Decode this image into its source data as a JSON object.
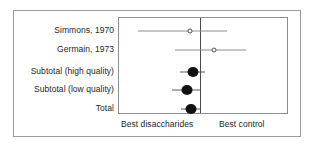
{
  "chart_data": {
    "type": "forest",
    "title": "",
    "xlabel": "",
    "ylabel": "",
    "grid": false,
    "null_line_value": 1.0,
    "xlim": [
      0.1,
      4.2
    ],
    "axis_captions": {
      "left": "Best disaccharides",
      "right": "Best control"
    },
    "marker_legend": {
      "open_circle": "individual study",
      "filled_circle": "pooled estimate"
    },
    "rows": [
      {
        "label": "Simmons, 1970",
        "marker": "open-circle",
        "estimate": 0.78,
        "ci_low": 0.22,
        "ci_high": 1.95,
        "crosses_null": true
      },
      {
        "label": "Germain, 1973",
        "marker": "open-circle",
        "estimate": 1.42,
        "ci_low": 0.55,
        "ci_high": 3.05,
        "crosses_null": true
      },
      {
        "label": "Subtotal (high quality)",
        "marker": "filled-circle",
        "estimate": 0.85,
        "ci_low": 0.62,
        "ci_high": 1.12,
        "crosses_null": true
      },
      {
        "label": "Subtotal (low quality)",
        "marker": "filled-circle",
        "estimate": 0.72,
        "ci_low": 0.5,
        "ci_high": 0.99,
        "crosses_null": false
      },
      {
        "label": "Total",
        "marker": "filled-circle",
        "estimate": 0.8,
        "ci_low": 0.63,
        "ci_high": 1.01,
        "crosses_null": true
      }
    ]
  },
  "colors": {
    "outer_border": "#9a9a9a",
    "plot_border": "#8d8d8d",
    "null_line": "#4a4a4a",
    "whisker": "#5d5d5d",
    "marker_fill": "#111111",
    "text": "#262626",
    "background": "#ffffff"
  }
}
